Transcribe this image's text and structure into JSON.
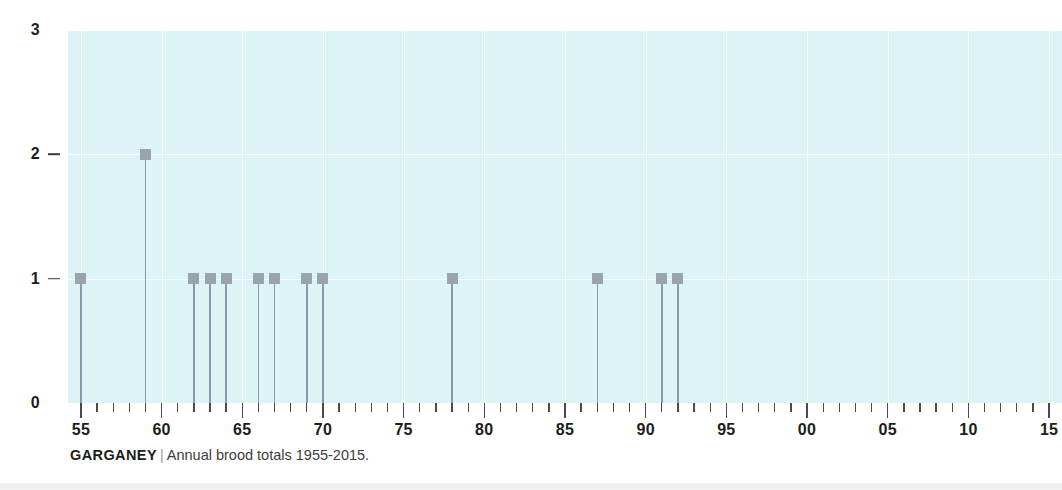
{
  "caption": {
    "species": "GARGANEY",
    "separator": "|",
    "description": "Annual brood totals 1955-2015."
  },
  "colors": {
    "plot_background": "#ddf3f6",
    "gridline": "#ffffff",
    "marker": "#9aa4ac",
    "stem": "#8a99a8",
    "axis_text": "#1d1d1b",
    "tick": "#4a4a48",
    "page_background": "#ffffff"
  },
  "chart_data": {
    "type": "bar",
    "xlabel": "",
    "ylabel": "",
    "xlim": [
      1954.2,
      2015.8
    ],
    "ylim": [
      0,
      3
    ],
    "grid": true,
    "legend": null,
    "y_ticks": [
      0,
      1,
      2,
      3
    ],
    "y_tick_labels": [
      "0",
      "1",
      "2",
      "3"
    ],
    "x_ticks": [
      1955,
      1960,
      1965,
      1970,
      1975,
      1980,
      1985,
      1990,
      1995,
      2000,
      2005,
      2010,
      2015
    ],
    "x_tick_labels": [
      "55",
      "60",
      "65",
      "70",
      "75",
      "80",
      "85",
      "90",
      "95",
      "00",
      "05",
      "10",
      "15"
    ],
    "x_minor_tick_interval": 1,
    "x": [
      1955,
      1956,
      1957,
      1958,
      1959,
      1960,
      1961,
      1962,
      1963,
      1964,
      1965,
      1966,
      1967,
      1968,
      1969,
      1970,
      1971,
      1972,
      1973,
      1974,
      1975,
      1976,
      1977,
      1978,
      1979,
      1980,
      1981,
      1982,
      1983,
      1984,
      1985,
      1986,
      1987,
      1988,
      1989,
      1990,
      1991,
      1992,
      1993,
      1994,
      1995,
      1996,
      1997,
      1998,
      1999,
      2000,
      2001,
      2002,
      2003,
      2004,
      2005,
      2006,
      2007,
      2008,
      2009,
      2010,
      2011,
      2012,
      2013,
      2014,
      2015
    ],
    "values": [
      1,
      0,
      0,
      0,
      2,
      0,
      0,
      1,
      1,
      1,
      0,
      1,
      1,
      0,
      1,
      1,
      0,
      0,
      0,
      0,
      0,
      0,
      0,
      1,
      0,
      0,
      0,
      0,
      0,
      0,
      0,
      0,
      1,
      0,
      0,
      0,
      1,
      1,
      0,
      0,
      0,
      0,
      0,
      0,
      0,
      0,
      0,
      0,
      0,
      0,
      0,
      0,
      0,
      0,
      0,
      0,
      0,
      0,
      0,
      0,
      0
    ],
    "nonzero_points": [
      {
        "year": 1955,
        "value": 1
      },
      {
        "year": 1959,
        "value": 2
      },
      {
        "year": 1962,
        "value": 1
      },
      {
        "year": 1963,
        "value": 1
      },
      {
        "year": 1964,
        "value": 1
      },
      {
        "year": 1966,
        "value": 1
      },
      {
        "year": 1967,
        "value": 1
      },
      {
        "year": 1969,
        "value": 1
      },
      {
        "year": 1970,
        "value": 1
      },
      {
        "year": 1978,
        "value": 1
      },
      {
        "year": 1987,
        "value": 1
      },
      {
        "year": 1991,
        "value": 1
      },
      {
        "year": 1992,
        "value": 1
      }
    ]
  }
}
